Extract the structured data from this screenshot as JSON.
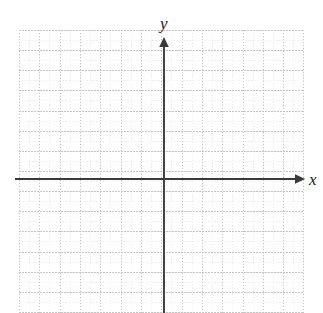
{
  "figure": {
    "kind": "blank-cartesian-coordinate-plane",
    "background_color": "#ffffff",
    "width": 323,
    "height": 313
  },
  "axes": {
    "x_label": "x",
    "y_label": "y",
    "axis_color": "#3a3a3a",
    "origin": {
      "x": 164,
      "y": 179
    },
    "x_axis": {
      "name": "x-axis",
      "start_px": 15,
      "end_px": 300,
      "y_px": 179,
      "arrow": "right-arrowhead"
    },
    "y_axis": {
      "name": "y-axis",
      "top_px": 41,
      "bottom_px": 313,
      "x_px": 164,
      "arrow": "up-arrowhead"
    }
  },
  "grid": {
    "name": "dotted-graph-grid",
    "left_px": 19,
    "top_px": 30,
    "width_px": 285,
    "height_px": 283,
    "major_spacing_x_px": 20.32,
    "major_spacing_y_px": 20.15,
    "minor_spacing_x_px": 10.16,
    "minor_spacing_y_px": 10.07,
    "major_color": "#c6c6c6",
    "minor_color": "#ededed",
    "line_style": "dotted",
    "major_columns": 14,
    "major_rows": 14
  },
  "chart_data": {
    "type": "scatter",
    "title": "",
    "subtitle": "",
    "xlabel": "x",
    "ylabel": "y",
    "series": [
      {
        "name": "",
        "x": [],
        "y": []
      }
    ],
    "annotations": [],
    "legend": {
      "entries": [],
      "position": "none"
    },
    "grid": true,
    "grid_style": "dotted",
    "xlim": [
      -7,
      7
    ],
    "ylim": [
      -7,
      7
    ],
    "xticks": [],
    "yticks": [],
    "xtick_labels": [],
    "ytick_labels": []
  }
}
